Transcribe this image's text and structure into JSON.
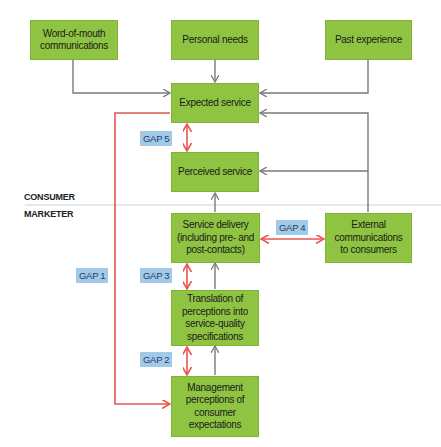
{
  "boxes": {
    "word_of_mouth": "Word-of-mouth communications",
    "personal_needs": "Personal needs",
    "past_experience": "Past experience",
    "expected_service": "Expected service",
    "perceived_service": "Perceived service",
    "service_delivery": "Service delivery (including pre- and post-contacts)",
    "external_comms": "External communications to consumers",
    "translation": "Translation of perceptions into service-quality specifications",
    "management": "Management perceptions of consumer expectations"
  },
  "gaps": {
    "gap1": "GAP 1",
    "gap2": "GAP 2",
    "gap3": "GAP 3",
    "gap4": "GAP 4",
    "gap5": "GAP 5"
  },
  "zones": {
    "consumer": "CONSUMER",
    "marketer": "MARKETER"
  },
  "colors": {
    "box_fill": "#8fc442",
    "gap_label": "#a3c9e8",
    "gap_arrow": "#e8554e",
    "flow_arrow": "#7a7a7a",
    "divider": "#cfcfcf"
  }
}
